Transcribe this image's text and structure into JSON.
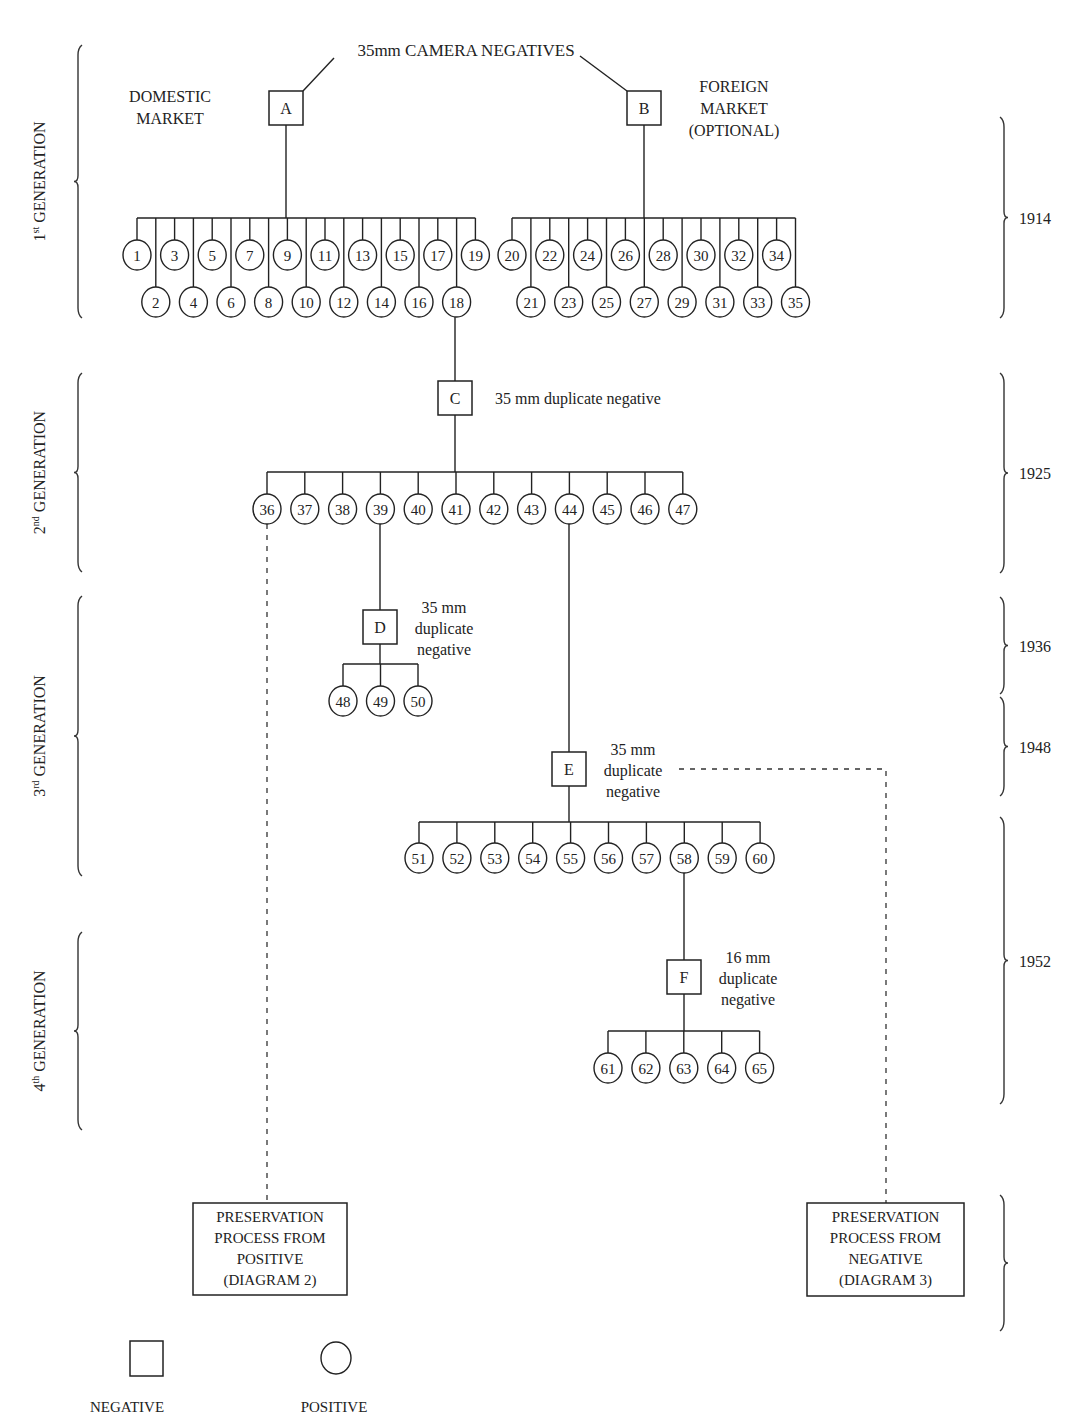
{
  "title": "35mm CAMERA NEGATIVES",
  "colors": {
    "ink": "#222222",
    "background": "#ffffff"
  },
  "labels": {
    "domestic": [
      "DOMESTIC",
      "MARKET"
    ],
    "foreign": [
      "FOREIGN",
      "MARKET",
      "(OPTIONAL)"
    ]
  },
  "generations": [
    {
      "ordinal": "1",
      "suffix": "st",
      "label": "GENERATION",
      "y1": 45,
      "y2": 318
    },
    {
      "ordinal": "2",
      "suffix": "nd",
      "label": "GENERATION",
      "y1": 373,
      "y2": 572
    },
    {
      "ordinal": "3",
      "suffix": "rd",
      "label": "GENERATION",
      "y1": 596,
      "y2": 876
    },
    {
      "ordinal": "4",
      "suffix": "th",
      "label": "GENERATION",
      "y1": 932,
      "y2": 1130
    }
  ],
  "years": [
    {
      "label": "1914",
      "y1": 117,
      "y2": 318
    },
    {
      "label": "1925",
      "y1": 373,
      "y2": 573
    },
    {
      "label": "1936",
      "y1": 597,
      "y2": 694
    },
    {
      "label": "1948",
      "y1": 697,
      "y2": 796
    },
    {
      "label": "1952",
      "y1": 817,
      "y2": 1104
    },
    {
      "label": "",
      "y1": 1195,
      "y2": 1331
    }
  ],
  "negatives": [
    {
      "id": "A",
      "x": 286,
      "y": 108,
      "note": []
    },
    {
      "id": "B",
      "x": 644,
      "y": 108,
      "note": []
    },
    {
      "id": "C",
      "x": 455,
      "y": 398,
      "note": [
        "35 mm duplicate negative"
      ]
    },
    {
      "id": "D",
      "x": 380,
      "y": 627,
      "note": [
        "35 mm",
        "duplicate",
        "negative"
      ]
    },
    {
      "id": "E",
      "x": 569,
      "y": 769,
      "note": [
        "35 mm",
        "duplicate",
        "negative"
      ]
    },
    {
      "id": "F",
      "x": 684,
      "y": 977,
      "note": [
        "16 mm",
        "duplicate",
        "negative"
      ]
    }
  ],
  "positive_groups": [
    {
      "parent": "A",
      "bar_y": 218,
      "x_start": 137,
      "x_step": 18.8,
      "items": [
        "1",
        "2",
        "3",
        "4",
        "5",
        "6",
        "7",
        "8",
        "9",
        "10",
        "11",
        "12",
        "13",
        "14",
        "15",
        "16",
        "17",
        "18",
        "19"
      ],
      "upper_y": 255,
      "lower_y": 302
    },
    {
      "parent": "B",
      "bar_y": 218,
      "x_start": 512,
      "x_step": 18.9,
      "items": [
        "20",
        "21",
        "22",
        "23",
        "24",
        "25",
        "26",
        "27",
        "28",
        "29",
        "30",
        "31",
        "32",
        "33",
        "34",
        "35"
      ],
      "upper_y": 255,
      "lower_y": 302
    },
    {
      "parent": "C",
      "bar_y": 472,
      "x_start": 267,
      "x_step": 37.8,
      "items": [
        "36",
        "37",
        "38",
        "39",
        "40",
        "41",
        "42",
        "43",
        "44",
        "45",
        "46",
        "47"
      ],
      "upper_y": 509,
      "lower_y": 509
    },
    {
      "parent": "D",
      "bar_y": 664,
      "x_start": 343,
      "x_step": 37.5,
      "items": [
        "48",
        "49",
        "50"
      ],
      "upper_y": 701,
      "lower_y": 701
    },
    {
      "parent": "E",
      "bar_y": 822,
      "x_start": 419,
      "x_step": 37.9,
      "items": [
        "51",
        "52",
        "53",
        "54",
        "55",
        "56",
        "57",
        "58",
        "59",
        "60"
      ],
      "upper_y": 858,
      "lower_y": 858
    },
    {
      "parent": "F",
      "bar_y": 1031,
      "x_start": 608,
      "x_step": 37.9,
      "items": [
        "61",
        "62",
        "63",
        "64",
        "65"
      ],
      "upper_y": 1068,
      "lower_y": 1068
    }
  ],
  "preservation": [
    {
      "id": "diagram-2",
      "x": 193,
      "y": 1203,
      "w": 154,
      "h": 92,
      "lines": [
        "PRESERVATION",
        "PROCESS FROM",
        "POSITIVE",
        "(DIAGRAM 2)"
      ]
    },
    {
      "id": "diagram-3",
      "x": 807,
      "y": 1203,
      "w": 157,
      "h": 93,
      "lines": [
        "PRESERVATION",
        "PROCESS FROM",
        "NEGATIVE",
        "(DIAGRAM 3)"
      ]
    }
  ],
  "legend": [
    {
      "shape": "square",
      "label": "NEGATIVE"
    },
    {
      "shape": "circle",
      "label": "POSITIVE"
    }
  ]
}
